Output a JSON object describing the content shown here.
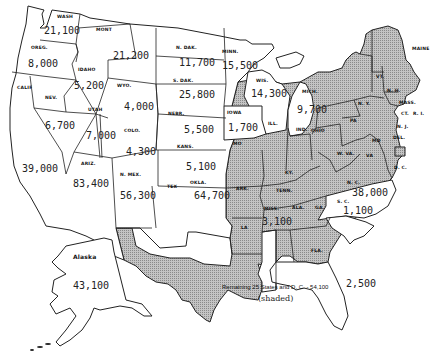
{
  "map": {
    "title": "",
    "legend": {
      "line1": "Remaining 25 States and  D. C.  - 54,100",
      "line2": "(shaded)"
    },
    "colors": {
      "unshaded": "#ffffff",
      "shaded": "#b8b8b8",
      "border": "#222222"
    },
    "states": {
      "wash": {
        "label": "WASH",
        "value": "21,100",
        "shaded": false
      },
      "oreg": {
        "label": "OREG.",
        "value": "8,000",
        "shaded": false
      },
      "calif": {
        "label": "CALIF",
        "value": "39,000",
        "shaded": false
      },
      "idaho": {
        "label": "IDAHO",
        "value": "5,200",
        "shaded": false
      },
      "nev": {
        "label": "NEV.",
        "value": "6,700",
        "shaded": false
      },
      "mont": {
        "label": "MONT",
        "value": "21,200",
        "shaded": false
      },
      "wyo": {
        "label": "WYO.",
        "value": "4,000",
        "shaded": false
      },
      "utah": {
        "label": "UTAH",
        "value": "7,000",
        "shaded": false
      },
      "colo": {
        "label": "COLO.",
        "value": "4,300",
        "shaded": false
      },
      "ariz": {
        "label": "ARIZ.",
        "value": "83,400",
        "shaded": false
      },
      "nmex": {
        "label": "N. MEX.",
        "value": "56,300",
        "shaded": false
      },
      "ndak": {
        "label": "N. DAK.",
        "value": "11,700",
        "shaded": false
      },
      "sdak": {
        "label": "S. DAK.",
        "value": "25,800",
        "shaded": false
      },
      "nebr": {
        "label": "NEBR.",
        "value": "5,500",
        "shaded": false
      },
      "kans": {
        "label": "KANS.",
        "value": "5,100",
        "shaded": false
      },
      "okla": {
        "label": "OKLA.",
        "value": "64,700",
        "shaded": false
      },
      "tex": {
        "label": "TEX",
        "value": "",
        "shaded": true
      },
      "minn": {
        "label": "MINN.",
        "value": "15,500",
        "shaded": false
      },
      "iowa": {
        "label": "IOWA",
        "value": "1,700",
        "shaded": false
      },
      "mo": {
        "label": "MO",
        "value": "",
        "shaded": true
      },
      "ark": {
        "label": "ARK.",
        "value": "",
        "shaded": true
      },
      "la": {
        "label": "LA",
        "value": "",
        "shaded": true
      },
      "wis": {
        "label": "WIS.",
        "value": "14,300",
        "shaded": false
      },
      "mich": {
        "label": "MICH.",
        "value": "9,700",
        "shaded": false
      },
      "ill": {
        "label": "ILL.",
        "value": "",
        "shaded": true
      },
      "ind": {
        "label": "IND.",
        "value": "",
        "shaded": true
      },
      "ohio": {
        "label": "OHIO",
        "value": "",
        "shaded": true
      },
      "ky": {
        "label": "KY.",
        "value": "",
        "shaded": true
      },
      "tenn": {
        "label": "TENN.",
        "value": "",
        "shaded": true
      },
      "miss": {
        "label": "MISS.",
        "value": "3,100",
        "shaded": false
      },
      "ala": {
        "label": "ALA.",
        "value": "",
        "shaded": true
      },
      "ga": {
        "label": "GA.",
        "value": "",
        "shaded": true
      },
      "fla": {
        "label": "FLA.",
        "value": "2,500",
        "shaded": false
      },
      "sc": {
        "label": "S. C.",
        "value": "1,100",
        "shaded": false
      },
      "nc": {
        "label": "N. C.",
        "value": "38,000",
        "shaded": false
      },
      "va": {
        "label": "VA",
        "value": "",
        "shaded": true
      },
      "wva": {
        "label": "W. VA.",
        "value": "",
        "shaded": true
      },
      "md": {
        "label": "MD",
        "value": "",
        "shaded": true
      },
      "del": {
        "label": "DEL.",
        "value": "",
        "shaded": true
      },
      "dc": {
        "label": "D. C.",
        "value": "",
        "shaded": true
      },
      "pa": {
        "label": "PA",
        "value": "",
        "shaded": true
      },
      "nj": {
        "label": "N. J.",
        "value": "",
        "shaded": true
      },
      "ny": {
        "label": "N. Y.",
        "value": "",
        "shaded": true
      },
      "conn": {
        "label": "CT.",
        "value": "",
        "shaded": true
      },
      "ri": {
        "label": "R. I.",
        "value": "",
        "shaded": true
      },
      "mass": {
        "label": "MASS.",
        "value": "",
        "shaded": true
      },
      "vt": {
        "label": "VT.",
        "value": "",
        "shaded": true
      },
      "nh": {
        "label": "N. H.",
        "value": "",
        "shaded": true
      },
      "maine": {
        "label": "MAINE",
        "value": "",
        "shaded": true
      },
      "alaska": {
        "label": "Alaska",
        "value": "43,100",
        "shaded": false
      }
    }
  }
}
